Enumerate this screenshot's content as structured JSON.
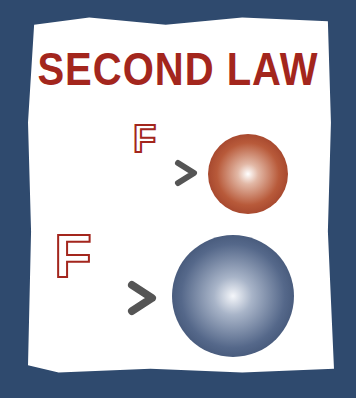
{
  "title": "SECOND LAW",
  "small_case": {
    "force_label": "F",
    "object": "small-red-ball",
    "ball_color": "#b85a3a"
  },
  "large_case": {
    "force_label": "F",
    "object": "large-blue-ball",
    "ball_color": "#55688a"
  },
  "colors": {
    "frame": "#2f4a6e",
    "title": "#a3261d",
    "arrow": "#555555"
  }
}
